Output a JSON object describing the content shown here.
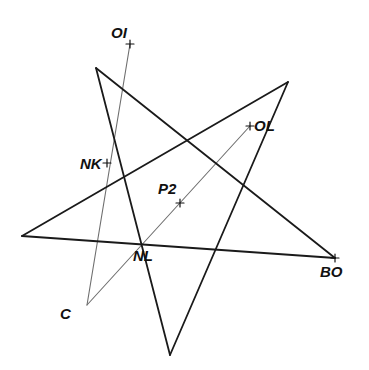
{
  "diagram": {
    "width": 369,
    "height": 370,
    "colors": {
      "background": "#ffffff",
      "star_stroke": "#1a1a1a",
      "construction_stroke": "#6e6e6e",
      "label": "#111111"
    },
    "star": {
      "vertices": [
        [
          96,
          68
        ],
        [
          170,
          355
        ],
        [
          288,
          82
        ],
        [
          22,
          236
        ],
        [
          335,
          258
        ]
      ],
      "stroke_width": 1.8
    },
    "construction_lines": [
      {
        "from": "OI",
        "to": "C"
      },
      {
        "from": "C",
        "to": "OL"
      }
    ],
    "points": [
      {
        "id": "OI",
        "label": "OI",
        "x": 130,
        "y": 44,
        "label_x": 111,
        "label_y": 38,
        "marker": "cross"
      },
      {
        "id": "OL",
        "label": "OL",
        "x": 250,
        "y": 126,
        "label_x": 254,
        "label_y": 131,
        "marker": "cross"
      },
      {
        "id": "NK",
        "label": "NK",
        "x": 107,
        "y": 163,
        "label_x": 80,
        "label_y": 169,
        "marker": "cross"
      },
      {
        "id": "P2",
        "label": "P2",
        "x": 180,
        "y": 203,
        "label_x": 158,
        "label_y": 194,
        "marker": "cross"
      },
      {
        "id": "NL",
        "label": "NL",
        "x": 141,
        "y": 242,
        "label_x": 133,
        "label_y": 261,
        "marker": "none"
      },
      {
        "id": "BO",
        "label": "BO",
        "x": 335,
        "y": 258,
        "label_x": 320,
        "label_y": 277,
        "marker": "cross"
      },
      {
        "id": "C",
        "label": "C",
        "x": 87,
        "y": 305,
        "label_x": 60,
        "label_y": 319,
        "marker": "none"
      }
    ]
  }
}
